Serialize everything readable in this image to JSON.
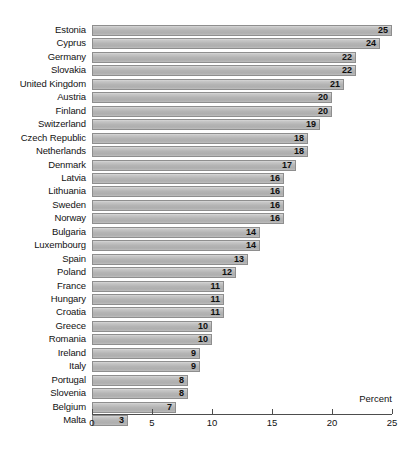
{
  "chart_data": {
    "type": "bar",
    "orientation": "horizontal",
    "title": "",
    "subtitle": "",
    "xlabel": "Percent",
    "ylabel": "",
    "xlim": [
      0,
      25
    ],
    "xticks": [
      0,
      5,
      10,
      15,
      20,
      25
    ],
    "xtick_labels": [
      "0",
      "5",
      "10",
      "15",
      "20",
      "25"
    ],
    "grid": false,
    "legend": null,
    "value_labels_shown": true,
    "bar_color": "#b8b8b8",
    "bar_border_color": "#8e8e8e",
    "axis_color": "#4d4d4d",
    "categories": [
      "Estonia",
      "Cyprus",
      "Germany",
      "Slovakia",
      "United Kingdom",
      "Austria",
      "Finland",
      "Switzerland",
      "Czech Republic",
      "Netherlands",
      "Denmark",
      "Latvia",
      "Lithuania",
      "Sweden",
      "Norway",
      "Bulgaria",
      "Luxembourg",
      "Spain",
      "Poland",
      "France",
      "Hungary",
      "Croatia",
      "Greece",
      "Romania",
      "Ireland",
      "Italy",
      "Portugal",
      "Slovenia",
      "Belgium",
      "Malta"
    ],
    "values": [
      25,
      24,
      22,
      22,
      21,
      20,
      20,
      19,
      18,
      18,
      17,
      16,
      16,
      16,
      16,
      14,
      14,
      13,
      12,
      11,
      11,
      11,
      10,
      10,
      9,
      9,
      8,
      8,
      7,
      3
    ],
    "value_labels": [
      "25",
      "24",
      "22",
      "22",
      "21",
      "20",
      "20",
      "19",
      "18",
      "18",
      "17",
      "16",
      "16",
      "16",
      "16",
      "14",
      "14",
      "13",
      "12",
      "11",
      "11",
      "11",
      "10",
      "10",
      "9",
      "9",
      "8",
      "8",
      "7",
      "3"
    ]
  }
}
